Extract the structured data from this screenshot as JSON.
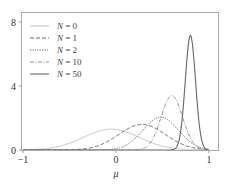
{
  "chart_data": {
    "type": "line",
    "title": "",
    "xlabel": "μ",
    "ylabel": "",
    "xlim": [
      -1,
      1.1
    ],
    "ylim": [
      0,
      8.6
    ],
    "xticks": [
      -1,
      0,
      1
    ],
    "xtick_labels": [
      "−1",
      "0",
      "1"
    ],
    "yticks": [
      0,
      4,
      8
    ],
    "ytick_labels": [
      "0",
      "4",
      "8"
    ],
    "grid": false,
    "legend_position": "upper left",
    "series": [
      {
        "name": "N = 0",
        "n": "0",
        "mean": -0.05,
        "sd": 0.3,
        "peak": 1.3,
        "color": "#b8b8b8",
        "dash": "",
        "width": 0.9
      },
      {
        "name": "N = 1",
        "n": "1",
        "mean": 0.28,
        "sd": 0.25,
        "peak": 1.6,
        "color": "#555555",
        "dash": "4,2",
        "width": 0.9
      },
      {
        "name": "N = 2",
        "n": "2",
        "mean": 0.48,
        "sd": 0.19,
        "peak": 2.05,
        "color": "#555555",
        "dash": "1.2,1.2",
        "width": 0.9
      },
      {
        "name": "N = 10",
        "n": "10",
        "mean": 0.6,
        "sd": 0.115,
        "peak": 3.4,
        "color": "#888888",
        "dash": "4,1.5,1,1.5",
        "width": 0.9
      },
      {
        "name": "N = 50",
        "n": "50",
        "mean": 0.8,
        "sd": 0.055,
        "peak": 7.15,
        "color": "#666666",
        "dash": "",
        "width": 1.1
      }
    ]
  },
  "legend": {
    "items": [
      {
        "prefix": "N",
        "label": " = 0"
      },
      {
        "prefix": "N",
        "label": " = 1"
      },
      {
        "prefix": "N",
        "label": " = 2"
      },
      {
        "prefix": "N",
        "label": " = 10"
      },
      {
        "prefix": "N",
        "label": " = 50"
      }
    ]
  }
}
